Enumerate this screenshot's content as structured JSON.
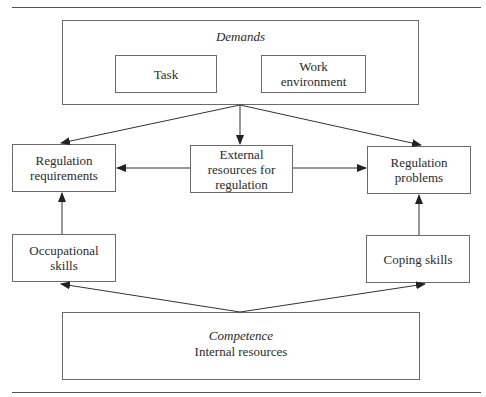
{
  "diagram": {
    "demands": {
      "title": "Demands",
      "task": "Task",
      "work_environment": "Work\nenvironment"
    },
    "regulation_requirements": "Regulation\nrequirements",
    "external_resources": "External\nresources for\nregulation",
    "regulation_problems": "Regulation\nproblems",
    "occupational_skills": "Occupational\nskills",
    "coping_skills": "Coping skills",
    "competence": {
      "title": "Competence",
      "subtitle": "Internal resources"
    },
    "arrows": [
      {
        "from": "demands",
        "to": "regulation_requirements"
      },
      {
        "from": "demands",
        "to": "external_resources"
      },
      {
        "from": "demands",
        "to": "regulation_problems"
      },
      {
        "from": "external_resources",
        "to": "regulation_requirements"
      },
      {
        "from": "external_resources",
        "to": "regulation_problems"
      },
      {
        "from": "occupational_skills",
        "to": "regulation_requirements"
      },
      {
        "from": "coping_skills",
        "to": "regulation_problems"
      },
      {
        "from": "competence",
        "to": "occupational_skills"
      },
      {
        "from": "competence",
        "to": "coping_skills"
      }
    ],
    "colors": {
      "line": "#333333",
      "box_border": "#6b6b6b"
    }
  }
}
